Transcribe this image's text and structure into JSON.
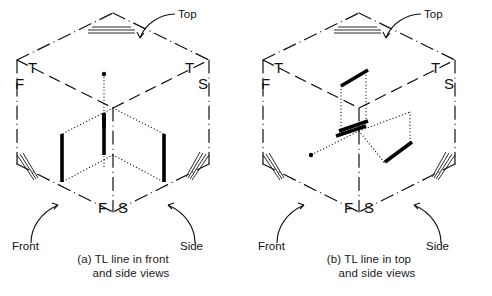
{
  "figure": {
    "panels": [
      {
        "id": "a",
        "caption_line_1": "(a) TL line in front",
        "caption_line_2": "and side views",
        "corner_labels": {
          "top_left_upper": "T",
          "top_left_lower": "F",
          "top_right_upper": "T",
          "top_right_lower": "S",
          "bottom_left": "F",
          "bottom_right": "S"
        },
        "leader_labels": {
          "top": "Top",
          "front": "Front",
          "side": "Side"
        }
      },
      {
        "id": "b",
        "caption_line_1": "(b) TL line in top",
        "caption_line_2": "and side views",
        "corner_labels": {
          "top_left_upper": "T",
          "top_left_lower": "F",
          "top_right_upper": "T",
          "top_right_lower": "S",
          "bottom_left": "F",
          "bottom_right": "S"
        },
        "leader_labels": {
          "top": "Top",
          "front": "Front",
          "side": "Side"
        }
      }
    ],
    "colors": {
      "ink": "#111111",
      "tl_line": "#000000",
      "background": "#ffffff"
    }
  }
}
